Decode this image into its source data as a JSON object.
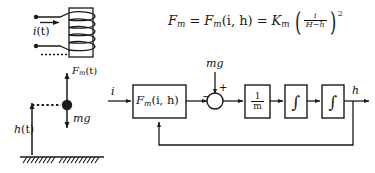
{
  "figure": {
    "ink_color": "#1a1a1a",
    "background": "#ffffff"
  },
  "equation": {
    "lhs": "F",
    "lhs_sub": "m",
    "eq1": "=",
    "mid": "F",
    "mid_sub": "m",
    "mid_args": "(i, h)",
    "eq2": "=",
    "gain": "K",
    "gain_sub": "m",
    "paren_open": "(",
    "fraction_numerator": "i",
    "fraction_denominator": "H−h",
    "paren_close": ")",
    "exponent": "2",
    "plain_text": "F_m = F_m(i, h) = K_m ( i / (H - h) )^2"
  },
  "coil_schematic": {
    "current_label": "i",
    "current_label_arg": "(t)",
    "turns": 4,
    "terminal_count": 2,
    "has_dashed_gap": true
  },
  "free_body": {
    "force_up_label": "F",
    "force_up_sub": "m",
    "force_up_arg": "(t)",
    "force_down_label": "mg",
    "height_label": "h",
    "height_label_arg": "(t)",
    "ball": "levitating-ball",
    "ground": "hatched-ground"
  },
  "block_diagram": {
    "input_label": "i",
    "output_label": "h",
    "disturbance_label": "mg",
    "blocks": [
      {
        "id": "force-block",
        "label": "F",
        "sub": "m",
        "args": "(i, h)"
      },
      {
        "id": "mass-block",
        "numerator": "1",
        "denominator": "m"
      },
      {
        "id": "integrator-1",
        "label": "∫"
      },
      {
        "id": "integrator-2",
        "label": "∫"
      }
    ],
    "summing_junction": {
      "name": "summing-junction",
      "sign_left": "−",
      "sign_top": "+"
    },
    "feedback": {
      "from": "output-h",
      "to": "force-block",
      "label": ""
    }
  }
}
